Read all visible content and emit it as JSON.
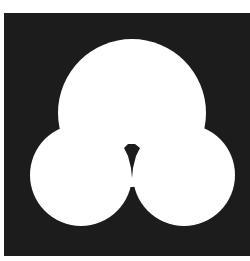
{
  "figure": {
    "background_color": "#1c1c1c",
    "shape_color": "#ffffff",
    "circles": [
      {
        "name": "top",
        "cx": 132,
        "cy": 113,
        "r": 74
      },
      {
        "name": "left",
        "cx": 81,
        "cy": 175,
        "r": 51
      },
      {
        "name": "right",
        "cx": 184,
        "cy": 175,
        "r": 51
      }
    ]
  }
}
